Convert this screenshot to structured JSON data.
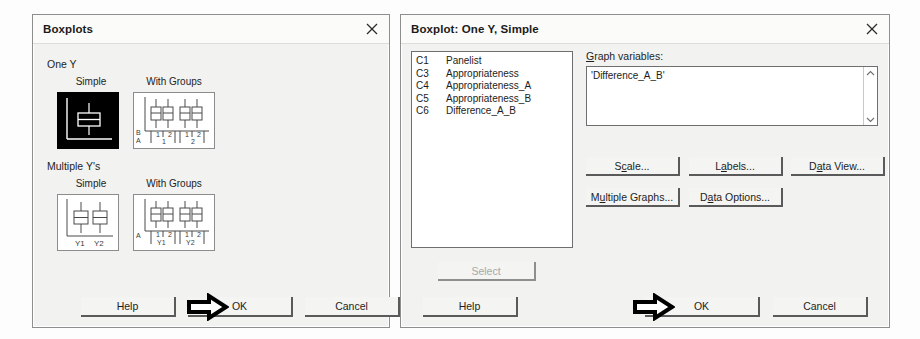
{
  "dialogs": {
    "boxplots": {
      "title": "Boxplots",
      "close_icon": "close-icon",
      "groups": [
        {
          "label": "One Y",
          "options": [
            {
              "label": "Simple",
              "selected": true
            },
            {
              "label": "With Groups",
              "selected": false
            }
          ]
        },
        {
          "label": "Multiple Y's",
          "options": [
            {
              "label": "Simple",
              "selected": false
            },
            {
              "label": "With Groups",
              "selected": false
            }
          ]
        }
      ],
      "thumb_axis_labels": {
        "one_y_groups_row1": [
          "1",
          "2",
          "1",
          "2"
        ],
        "one_y_groups_row2": [
          "1",
          "2"
        ],
        "one_y_groups_axis_top": "B",
        "one_y_groups_axis_bottom": "A",
        "multi_simple": [
          "Y1",
          "Y2"
        ],
        "multi_groups_row1": [
          "1",
          "2",
          "1",
          "2"
        ],
        "multi_groups_row2": [
          "Y1",
          "Y2"
        ],
        "multi_groups_axis": "A"
      },
      "buttons": {
        "help": "Help",
        "ok": "OK",
        "ok_mnemonic": "O",
        "cancel": "Cancel"
      },
      "annotation": "arrow-pointing-at-ok"
    },
    "boxplot_one_y_simple": {
      "title": "Boxplot: One Y, Simple",
      "close_icon": "close-icon",
      "variables": [
        {
          "id": "C1",
          "name": "Panelist"
        },
        {
          "id": "C3",
          "name": "Appropriateness"
        },
        {
          "id": "C4",
          "name": "Appropriateness_A"
        },
        {
          "id": "C5",
          "name": "Appropriateness_B"
        },
        {
          "id": "C6",
          "name": "Difference_A_B"
        }
      ],
      "graph_variables": {
        "label": "Graph variables:",
        "label_mnemonic": "G",
        "value": "'Difference_A_B'",
        "scroll_up_icon": "chevron-up-icon",
        "scroll_down_icon": "chevron-down-icon"
      },
      "select_button": {
        "label": "Select",
        "disabled": true
      },
      "option_buttons": [
        {
          "label": "Scale...",
          "mnemonic_index": 1
        },
        {
          "label": "Labels...",
          "mnemonic_index": 1
        },
        {
          "label": "Data View...",
          "mnemonic_index": 1
        },
        {
          "label": "Multiple Graphs...",
          "mnemonic_index": 1
        },
        {
          "label": "Data Options...",
          "mnemonic_index": 1
        }
      ],
      "buttons": {
        "help": "Help",
        "ok": "OK",
        "ok_mnemonic": "O",
        "cancel": "Cancel"
      },
      "annotation": "arrow-pointing-at-ok"
    }
  }
}
